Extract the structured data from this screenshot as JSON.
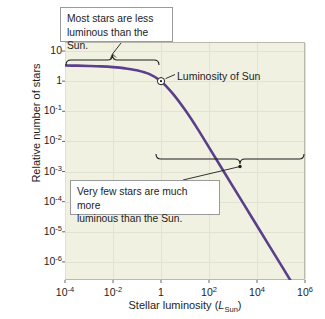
{
  "chart_data": {
    "type": "line",
    "title": "",
    "xlabel": "Stellar luminosity (L_Sun)",
    "xlabel_main": "Stellar luminosity (",
    "xlabel_sym": "L",
    "xlabel_sub": "Sun",
    "xlabel_tail": ")",
    "ylabel": "Relative number of stars",
    "xlim": [
      -4,
      6
    ],
    "ylim": [
      -6.6,
      1.3
    ],
    "xscale": "log",
    "yscale": "log",
    "grid": true,
    "legend": "none",
    "xticks": [
      {
        "exp": "-4",
        "base": "10",
        "value": -4
      },
      {
        "exp": "-2",
        "base": "10",
        "value": -2
      },
      {
        "exp": "",
        "base": "1",
        "value": 0
      },
      {
        "exp": "2",
        "base": "10",
        "value": 2
      },
      {
        "exp": "4",
        "base": "10",
        "value": 4
      },
      {
        "exp": "6",
        "base": "10",
        "value": 6
      }
    ],
    "yticks": [
      {
        "base": "10",
        "exp": "",
        "value": 1
      },
      {
        "base": "1",
        "exp": "",
        "value": 0
      },
      {
        "base": "10",
        "exp": "-1",
        "value": -1
      },
      {
        "base": "10",
        "exp": "-2",
        "value": -2
      },
      {
        "base": "10",
        "exp": "-3",
        "value": -3
      },
      {
        "base": "10",
        "exp": "-4",
        "value": -4
      },
      {
        "base": "10",
        "exp": "-5",
        "value": -5
      },
      {
        "base": "10",
        "exp": "-6",
        "value": -6
      }
    ],
    "series": [
      {
        "name": "Stellar luminosity function",
        "color": "#5b3f8c",
        "points": [
          {
            "x": -4.0,
            "y": 0.52
          },
          {
            "x": -3.5,
            "y": 0.515
          },
          {
            "x": -3.0,
            "y": 0.505
          },
          {
            "x": -2.5,
            "y": 0.49
          },
          {
            "x": -2.0,
            "y": 0.465
          },
          {
            "x": -1.5,
            "y": 0.425
          },
          {
            "x": -1.0,
            "y": 0.36
          },
          {
            "x": -0.5,
            "y": 0.24
          },
          {
            "x": 0.0,
            "y": 0.0
          },
          {
            "x": 0.5,
            "y": -0.42
          },
          {
            "x": 1.0,
            "y": -0.95
          },
          {
            "x": 1.5,
            "y": -1.55
          },
          {
            "x": 2.0,
            "y": -2.2
          },
          {
            "x": 2.5,
            "y": -2.85
          },
          {
            "x": 3.0,
            "y": -3.5
          },
          {
            "x": 3.5,
            "y": -4.15
          },
          {
            "x": 4.0,
            "y": -4.8
          },
          {
            "x": 4.5,
            "y": -5.45
          },
          {
            "x": 5.0,
            "y": -6.1
          },
          {
            "x": 5.5,
            "y": -6.75
          },
          {
            "x": 6.0,
            "y": -7.4
          }
        ]
      }
    ],
    "markers": [
      {
        "name": "sun-marker",
        "x": 0,
        "y": 0,
        "label": "Luminosity of Sun"
      }
    ],
    "annotations": [
      {
        "name": "most-stars-callout",
        "text": "Most stars are less\nluminous than the Sun.",
        "bracket": {
          "from_x": -4,
          "to_x": 0.1,
          "direction": "up"
        }
      },
      {
        "name": "very-few-stars-callout",
        "text": "Very few stars are much more\nluminous than the Sun.",
        "bracket": {
          "from_x": 0.1,
          "to_x": 6,
          "direction": "down"
        }
      }
    ]
  },
  "labels": {
    "sun_marker_label": "Luminosity of Sun",
    "callout_top": "Most stars are less\nluminous than the Sun.",
    "callout_bottom": "Very few stars are much more\nluminous than the Sun.",
    "y_axis_title": "Relative number of stars"
  },
  "colors": {
    "curve": "#5b3f8c",
    "plot_bg": "#f1f1e2",
    "grid": "#e2e2d2",
    "axis": "#b9b9ac",
    "text": "#1d1d1d",
    "callout_border": "#9a9a9a",
    "callout_bg": "#ffffff"
  }
}
